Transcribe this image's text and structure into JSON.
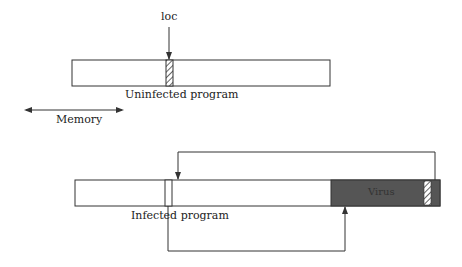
{
  "diagram": {
    "top": {
      "pointer_label": "loc",
      "caption": "Uninfected program"
    },
    "memory_label": "Memory",
    "bottom": {
      "virus_label": "Virus",
      "caption": "Infected program"
    },
    "colors": {
      "line": "#333333",
      "virus_fill": "#555555",
      "virus_text": "#333333"
    }
  }
}
